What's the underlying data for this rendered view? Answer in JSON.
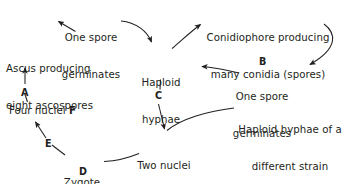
{
  "diagram": {
    "background_color": "#ffffff",
    "text_color": "#231f20",
    "nodes": [
      {
        "id": "one_spore_germinates_top",
        "line1": "One spore",
        "line2": "germinates"
      },
      {
        "id": "ascus",
        "line1": "Ascus producing",
        "line2": "eight ascospores"
      },
      {
        "id": "conidiophore",
        "line1": "Conidiophore producing",
        "line2": "many conidia (spores)"
      },
      {
        "id": "haploid_hyphae",
        "line1": "Haploid",
        "line2": "hyphae"
      },
      {
        "id": "one_spore_germinates_right",
        "line1": "One spore",
        "line2": "germinates"
      },
      {
        "id": "haploid_hyphae_different_strain",
        "line1": "Haploid hyphae of a",
        "line2": "different strain"
      },
      {
        "id": "four_nuclei",
        "text": "Four nuclei ",
        "bold_suffix": "F"
      },
      {
        "id": "zygote",
        "text": "Zygote"
      },
      {
        "id": "two_nuclei_fuse",
        "line1": "Two nuclei",
        "line2": "fuse"
      }
    ],
    "step_labels": [
      {
        "id": "step-a",
        "text": "A"
      },
      {
        "id": "step-b",
        "text": "B"
      },
      {
        "id": "step-c",
        "text": "C"
      },
      {
        "id": "step-d",
        "text": "D"
      },
      {
        "id": "step-e",
        "text": "E"
      },
      {
        "id": "step-f",
        "text": "F"
      }
    ]
  }
}
